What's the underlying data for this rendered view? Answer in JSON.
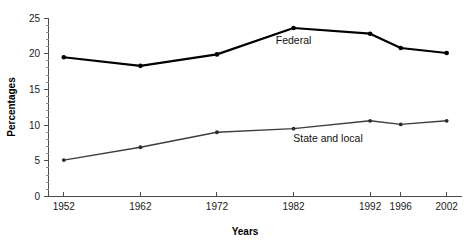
{
  "chart_data": {
    "type": "line",
    "title": "",
    "xlabel": "Years",
    "ylabel": "Percentages",
    "categories": [
      "1952",
      "1962",
      "1972",
      "1982",
      "1992",
      "1996",
      "2002"
    ],
    "x": [
      1952,
      1962,
      1972,
      1982,
      1992,
      1996,
      2002
    ],
    "xlim": [
      1950,
      2004
    ],
    "ylim": [
      0,
      25
    ],
    "yticks": [
      0,
      5,
      10,
      15,
      20,
      25
    ],
    "ytick_labels": [
      "0",
      "5",
      "10",
      "15",
      "20",
      "25"
    ],
    "y_minor_tick_interval": 1,
    "grid": false,
    "legend": "inline-annotations",
    "series": [
      {
        "name": "Federal",
        "color": "#000000",
        "values": [
          19.5,
          18.3,
          19.9,
          23.6,
          22.8,
          20.8,
          20.1
        ],
        "annotation": {
          "text": "Federal",
          "x": 1982,
          "y": 21.3
        }
      },
      {
        "name": "State and local",
        "color": "#3d3d3d",
        "values": [
          5.1,
          6.9,
          9.0,
          9.5,
          10.6,
          10.1,
          10.6
        ],
        "annotation": {
          "text": "State and local",
          "x": 1986.5,
          "y": 7.6
        }
      }
    ]
  },
  "axis": {
    "x_title": "Years",
    "y_title": "Percentages"
  },
  "colors": {
    "federal": "#000000",
    "state_and_local": "#3d3d3d",
    "axis": "#4c4c4c",
    "background": "#ffffff"
  }
}
